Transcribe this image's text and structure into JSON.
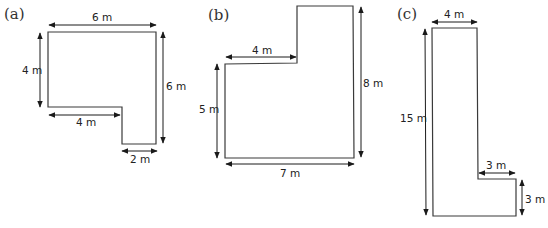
{
  "figures": [
    {
      "id": "a",
      "label": "(a)",
      "shape": "L-shape with notch at bottom-left",
      "dimensions": {
        "top": "6 m",
        "left": "4 m",
        "right": "6 m",
        "inner_horizontal": "4 m",
        "bottom": "2 m"
      }
    },
    {
      "id": "b",
      "label": "(b)",
      "shape": "L-shape with notch at top-left",
      "dimensions": {
        "inner_horizontal": "4 m",
        "left": "5 m",
        "right": "8 m",
        "bottom": "7 m"
      }
    },
    {
      "id": "c",
      "label": "(c)",
      "shape": "L-shape",
      "dimensions": {
        "top": "4 m",
        "left": "15 m",
        "inner_horizontal": "3 m",
        "right": "3 m"
      }
    }
  ],
  "colors": {
    "outline": "#3a3a3a",
    "arrow": "#1a1a1a",
    "background": "#ffffff"
  }
}
